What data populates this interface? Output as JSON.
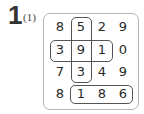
{
  "problem": {
    "number": "1",
    "sub_label": "(1)"
  },
  "grid": {
    "rows": [
      [
        "8",
        "5",
        "2",
        "9"
      ],
      [
        "3",
        "9",
        "1",
        "0"
      ],
      [
        "7",
        "3",
        "4",
        "9"
      ],
      [
        "8",
        "1",
        "8",
        "6"
      ]
    ],
    "groups": [
      {
        "orientation": "vertical",
        "cells": [
          [
            0,
            1
          ],
          [
            1,
            1
          ],
          [
            2,
            1
          ]
        ],
        "values": [
          "5",
          "9",
          "3"
        ]
      },
      {
        "orientation": "horizontal",
        "cells": [
          [
            1,
            0
          ],
          [
            1,
            1
          ],
          [
            1,
            2
          ]
        ],
        "values": [
          "3",
          "9",
          "1"
        ]
      },
      {
        "orientation": "horizontal",
        "cells": [
          [
            3,
            1
          ],
          [
            3,
            2
          ],
          [
            3,
            3
          ]
        ],
        "values": [
          "1",
          "8",
          "6"
        ]
      }
    ]
  }
}
